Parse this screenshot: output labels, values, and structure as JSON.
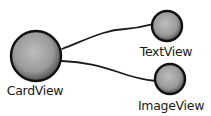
{
  "diagram": {
    "type": "tree",
    "colors": {
      "node_fill_center": "#b9b9b9",
      "node_fill_edge": "#5e5e5e",
      "outline": "#111111",
      "edge": "#1c1c1c",
      "label": "#1a1a1a"
    },
    "nodes": [
      {
        "id": "cardview",
        "label": "CardView",
        "role": "parent"
      },
      {
        "id": "textview",
        "label": "TextView",
        "role": "child"
      },
      {
        "id": "imageview",
        "label": "ImageView",
        "role": "child"
      }
    ],
    "edges": [
      {
        "from": "cardview",
        "to": "textview"
      },
      {
        "from": "cardview",
        "to": "imageview"
      }
    ]
  }
}
